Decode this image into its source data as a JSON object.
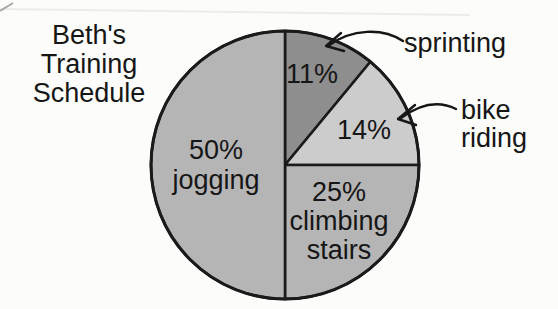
{
  "title": {
    "lines": [
      "Beth's",
      "Training",
      "Schedule"
    ]
  },
  "chart_data": {
    "type": "pie",
    "title": "Beth's Training Schedule",
    "start_angle_deg": 0,
    "direction": "clockwise",
    "outline_color": "#1a1a1a",
    "background_color": "#fcfcfa",
    "slices": [
      {
        "name": "sprinting",
        "pct": 11,
        "color": "#8e8e8e",
        "label_lines": [
          "11%"
        ]
      },
      {
        "name": "bike riding",
        "pct": 14,
        "color": "#cccccc",
        "label_lines": [
          "14%"
        ]
      },
      {
        "name": "climbing stairs",
        "pct": 25,
        "color": "#b5b5b5",
        "label_lines": [
          "25%",
          "climbing",
          "stairs"
        ]
      },
      {
        "name": "jogging",
        "pct": 50,
        "color": "#b5b5b5",
        "label_lines": [
          "50%",
          "jogging"
        ]
      }
    ],
    "callouts": [
      {
        "target": "sprinting",
        "text_lines": [
          "sprinting"
        ]
      },
      {
        "target": "bike riding",
        "text_lines": [
          "bike",
          "riding"
        ]
      }
    ]
  }
}
